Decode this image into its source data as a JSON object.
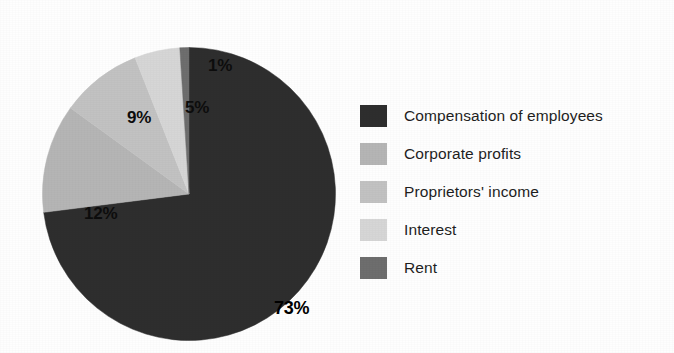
{
  "chart_data": {
    "type": "pie",
    "title": "",
    "subtitle": "",
    "xlabel": "",
    "ylabel": "",
    "legend_position": "right",
    "grid": false,
    "start_angle_deg": 0,
    "direction": "clockwise",
    "categories": [
      "Compensation of employees",
      "Corporate profits",
      "Proprietors' income",
      "Interest",
      "Rent"
    ],
    "values": [
      73,
      12,
      9,
      5,
      1
    ],
    "value_unit": "%",
    "data_labels": [
      "73%",
      "12%",
      "9%",
      "5%",
      "1%"
    ],
    "colors": [
      "#2e2e2e",
      "#b5b5b5",
      "#c2c2c2",
      "#d6d6d6",
      "#6e6e6e"
    ],
    "slices": [
      {
        "label": "Compensation of employees",
        "value": 73,
        "data_label": "73%",
        "color": "#2e2e2e"
      },
      {
        "label": "Corporate profits",
        "value": 12,
        "data_label": "12%",
        "color": "#b5b5b5"
      },
      {
        "label": "Proprietors' income",
        "value": 9,
        "data_label": "9%",
        "color": "#c2c2c2"
      },
      {
        "label": "Interest",
        "value": 5,
        "data_label": "5%",
        "color": "#d6d6d6"
      },
      {
        "label": "Rent",
        "value": 1,
        "data_label": "1%",
        "color": "#6e6e6e"
      }
    ]
  },
  "legend": {
    "items": [
      {
        "label": "Compensation of employees",
        "color": "#2e2e2e"
      },
      {
        "label": "Corporate profits",
        "color": "#b5b5b5"
      },
      {
        "label": "Proprietors' income",
        "color": "#c2c2c2"
      },
      {
        "label": "Interest",
        "color": "#d6d6d6"
      },
      {
        "label": "Rent",
        "color": "#6e6e6e"
      }
    ]
  },
  "labels": {
    "compensation": "73%",
    "corporate": "12%",
    "proprietors": "9%",
    "interest": "5%",
    "rent": "1%"
  },
  "colors": {
    "background": "#ffffff",
    "text": "#1f1f1f",
    "label_text": "#0d0d0d"
  }
}
